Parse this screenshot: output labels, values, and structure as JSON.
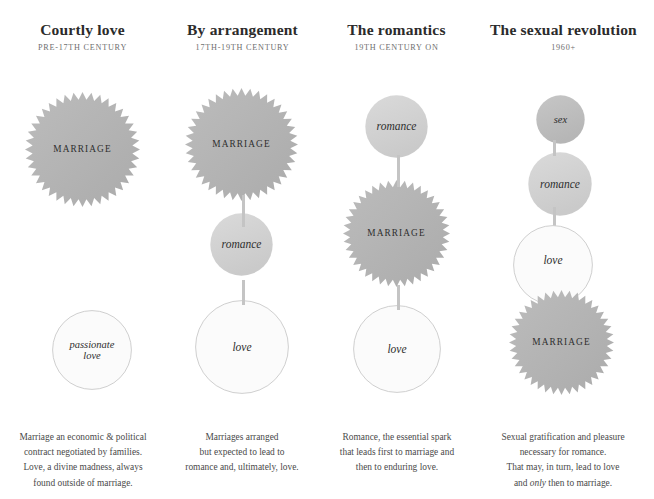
{
  "page": {
    "background": "#ffffff",
    "text_color": "#3a3a3a"
  },
  "palette": {
    "marriage_fill": "#b3b3b3",
    "romance_fill": "#d2d2d2",
    "sex_fill": "#bdbdbd",
    "love_fill": "#fbfbfb",
    "love_stroke": "#c9c9c9",
    "connector": "#c4c4c4",
    "title": "#2b2b2b",
    "subtitle": "#6e6e6e"
  },
  "columns": [
    {
      "id": "courtly-love",
      "title": "Courtly love",
      "subtitle": "Pre-17th century",
      "nodes": [
        {
          "key": "marriage",
          "label": "Marriage",
          "shape": "starburst",
          "style": "caps"
        },
        {
          "key": "passionate-love",
          "label": "passionate\nlove",
          "shape": "circle",
          "style": "italic"
        }
      ],
      "caption": "Marriage an economic & political contract negotiated by families. Love, a divine madness, always found outside of marriage.",
      "caption_lines": [
        "Marriage an economic & political",
        "contract negotiated by families.",
        "Love, a divine madness, always",
        "found outside of marriage."
      ]
    },
    {
      "id": "by-arrangement",
      "title": "By arrangement",
      "subtitle": "17th-19th century",
      "nodes": [
        {
          "key": "marriage",
          "label": "Marriage",
          "shape": "starburst",
          "style": "caps"
        },
        {
          "key": "romance",
          "label": "romance",
          "shape": "circle",
          "style": "italic"
        },
        {
          "key": "love",
          "label": "love",
          "shape": "circle",
          "style": "italic"
        }
      ],
      "caption": "Marriages arranged but expected to lead to romance and, ultimately, love.",
      "caption_lines": [
        "Marriages arranged",
        "but expected to lead to",
        "romance and, ultimately, love."
      ]
    },
    {
      "id": "the-romantics",
      "title": "The romantics",
      "subtitle": "19th century on",
      "nodes": [
        {
          "key": "romance",
          "label": "romance",
          "shape": "circle",
          "style": "italic"
        },
        {
          "key": "marriage",
          "label": "Marriage",
          "shape": "starburst",
          "style": "caps"
        },
        {
          "key": "love",
          "label": "love",
          "shape": "circle",
          "style": "italic"
        }
      ],
      "caption": "Romance, the essential spark that leads first to marriage and then to enduring love.",
      "caption_lines": [
        "Romance, the essential spark",
        "that leads first to marriage and",
        "then to enduring love."
      ]
    },
    {
      "id": "the-sexual-revolution",
      "title": "The sexual revolution",
      "subtitle": "1960+",
      "nodes": [
        {
          "key": "sex",
          "label": "sex",
          "shape": "circle",
          "style": "italic"
        },
        {
          "key": "romance",
          "label": "romance",
          "shape": "circle",
          "style": "italic"
        },
        {
          "key": "love",
          "label": "love",
          "shape": "circle",
          "style": "italic"
        },
        {
          "key": "marriage",
          "label": "Marriage",
          "shape": "starburst",
          "style": "caps"
        }
      ],
      "caption": "Sexual gratification and pleasure necessary for romance. That may, in turn, lead to love and only then to marriage.",
      "caption_lines": [
        "Sexual gratification and pleasure",
        "necessary for romance.",
        "That may, in turn, lead to love",
        "and only then to marriage."
      ],
      "caption_emphasis": "only"
    }
  ]
}
